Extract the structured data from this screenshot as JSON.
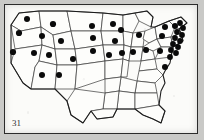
{
  "figure": {
    "label": "31",
    "frame_color": "#2b2b2b",
    "paper_color": "#fbfbf9",
    "background_color": "#c9c9c7",
    "state_line_color": "#3a3a3a",
    "outline_color": "#1c1c1c",
    "dot_color": "#0a0a0a"
  },
  "chart_data": {
    "type": "scatter",
    "xlabel": "",
    "ylabel": "",
    "xlim": [
      0,
      192
    ],
    "ylim": [
      0,
      128
    ],
    "grid": false,
    "legend": "none",
    "annotations": [
      "31"
    ],
    "marker": {
      "shape": "circle",
      "color": "#0a0a0a",
      "radius_px": 3.1
    },
    "points": [
      {
        "region": "WA",
        "x": 22,
        "y": 14,
        "r": 3.0
      },
      {
        "region": "OR",
        "x": 14,
        "y": 28,
        "r": 3.1
      },
      {
        "region": "ID",
        "x": 37,
        "y": 31,
        "r": 3.0
      },
      {
        "region": "MT",
        "x": 48,
        "y": 19,
        "r": 3.1
      },
      {
        "region": "ND",
        "x": 87,
        "y": 21,
        "r": 3.0
      },
      {
        "region": "MN",
        "x": 108,
        "y": 19,
        "r": 3.0
      },
      {
        "region": "CA",
        "x": 8,
        "y": 47,
        "r": 3.1
      },
      {
        "region": "NV",
        "x": 29,
        "y": 48,
        "r": 3.0
      },
      {
        "region": "UT",
        "x": 44,
        "y": 50,
        "r": 3.0
      },
      {
        "region": "WY",
        "x": 56,
        "y": 36,
        "r": 3.0
      },
      {
        "region": "CO",
        "x": 68,
        "y": 54,
        "r": 3.0
      },
      {
        "region": "SD",
        "x": 88,
        "y": 33,
        "r": 3.0
      },
      {
        "region": "NE",
        "x": 88,
        "y": 46,
        "r": 3.0
      },
      {
        "region": "IA",
        "x": 110,
        "y": 36,
        "r": 3.0
      },
      {
        "region": "WI",
        "x": 116,
        "y": 25,
        "r": 3.0
      },
      {
        "region": "MI",
        "x": 134,
        "y": 30,
        "r": 3.0
      },
      {
        "region": "IL",
        "x": 117,
        "y": 48,
        "r": 3.0
      },
      {
        "region": "IN",
        "x": 128,
        "y": 47,
        "r": 3.0
      },
      {
        "region": "OH",
        "x": 141,
        "y": 45,
        "r": 3.0
      },
      {
        "region": "MO",
        "x": 104,
        "y": 50,
        "r": 3.0
      },
      {
        "region": "AZ",
        "x": 37,
        "y": 70,
        "r": 3.0
      },
      {
        "region": "NM",
        "x": 54,
        "y": 70,
        "r": 3.0
      },
      {
        "region": "KY",
        "x": 155,
        "y": 46,
        "r": 3.0
      },
      {
        "region": "PA",
        "x": 157,
        "y": 31,
        "r": 3.0
      },
      {
        "region": "NY",
        "x": 160,
        "y": 22,
        "r": 3.0
      },
      {
        "region": "NE-1",
        "x": 170,
        "y": 21,
        "r": 3.0
      },
      {
        "region": "NE-2",
        "x": 175,
        "y": 18,
        "r": 2.9
      },
      {
        "region": "NE-3",
        "x": 178,
        "y": 23,
        "r": 2.9
      },
      {
        "region": "NE-4",
        "x": 172,
        "y": 27,
        "r": 2.9
      },
      {
        "region": "NE-5",
        "x": 177,
        "y": 30,
        "r": 2.9
      },
      {
        "region": "NE-6",
        "x": 170,
        "y": 33,
        "r": 2.9
      },
      {
        "region": "NE-7",
        "x": 175,
        "y": 36,
        "r": 2.9
      },
      {
        "region": "NE-8",
        "x": 168,
        "y": 39,
        "r": 2.9
      },
      {
        "region": "NE-9",
        "x": 173,
        "y": 42,
        "r": 2.9
      },
      {
        "region": "NE-10",
        "x": 166,
        "y": 45,
        "r": 2.9
      },
      {
        "region": "NE-11",
        "x": 171,
        "y": 48,
        "r": 2.9
      },
      {
        "region": "NE-12",
        "x": 165,
        "y": 52,
        "r": 2.9
      },
      {
        "region": "NC",
        "x": 160,
        "y": 62,
        "r": 3.0
      }
    ]
  }
}
